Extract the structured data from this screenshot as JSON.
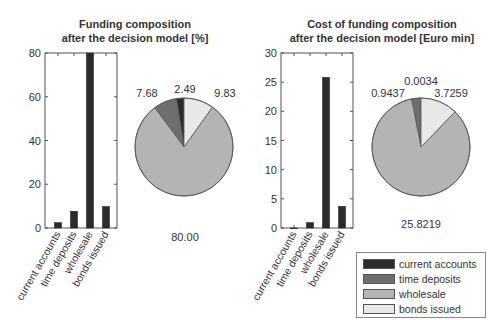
{
  "colors": {
    "current_accounts": "#2b2b2b",
    "time_deposits": "#6e6e6e",
    "wholesale": "#b4b4b4",
    "bonds_issued": "#e8e8e8",
    "bar": "#2b2b2b",
    "axis": "#555555"
  },
  "left_chart": {
    "title_line1": "Funding composition",
    "title_line2": "after the decision model [%]"
  },
  "right_chart": {
    "title_line1": "Cost of funding composition",
    "title_line2": "after the decision model [Euro min]"
  },
  "legend": {
    "items": [
      {
        "label": "current accounts"
      },
      {
        "label": "time deposits"
      },
      {
        "label": "wholesale"
      },
      {
        "label": "bonds issued"
      }
    ]
  },
  "chart_data": [
    {
      "type": "bar",
      "title": "Funding composition after the decision model [%]",
      "categories": [
        "current accounts",
        "time deposits",
        "wholesale",
        "bonds issued"
      ],
      "values": [
        2.49,
        7.68,
        80.0,
        9.83
      ],
      "xlabel": "",
      "ylabel": "",
      "ylim": [
        0,
        80
      ],
      "yticks": [
        0,
        20,
        40,
        60,
        80
      ],
      "grid": false
    },
    {
      "type": "pie",
      "title": "Funding composition after the decision model [%]",
      "categories": [
        "current accounts",
        "time deposits",
        "wholesale",
        "bonds issued"
      ],
      "values": [
        2.49,
        7.68,
        80.0,
        9.83
      ],
      "labels": [
        "2.49",
        "7.68",
        "80.00",
        "9.83"
      ]
    },
    {
      "type": "bar",
      "title": "Cost of funding composition after the decision model [Euro min]",
      "categories": [
        "current accounts",
        "time deposits",
        "wholesale",
        "bonds issued"
      ],
      "values": [
        0.0034,
        0.9437,
        25.8219,
        3.7259
      ],
      "xlabel": "",
      "ylabel": "",
      "ylim": [
        0,
        30
      ],
      "yticks": [
        0,
        5,
        10,
        15,
        20,
        25,
        30
      ],
      "grid": false
    },
    {
      "type": "pie",
      "title": "Cost of funding composition after the decision model [Euro min]",
      "categories": [
        "current accounts",
        "time deposits",
        "wholesale",
        "bonds issued"
      ],
      "values": [
        0.0034,
        0.9437,
        25.8219,
        3.7259
      ],
      "labels": [
        "0.0034",
        "0.9437",
        "25.8219",
        "3.7259"
      ],
      "legend_position": "bottom-right"
    }
  ]
}
